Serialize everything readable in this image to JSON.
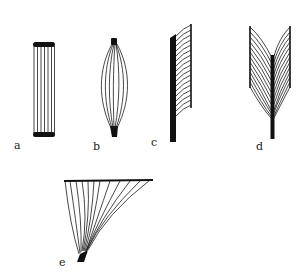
{
  "diagram": {
    "colors": {
      "ink": "#111111",
      "background": "#ffffff"
    },
    "panels": [
      {
        "id": "a",
        "label": "a",
        "shape": "parallel (strap) fibers"
      },
      {
        "id": "b",
        "label": "b",
        "shape": "fusiform fibers"
      },
      {
        "id": "c",
        "label": "c",
        "shape": "unipennate fibers"
      },
      {
        "id": "d",
        "label": "d",
        "shape": "bipennate fibers"
      },
      {
        "id": "e",
        "label": "e",
        "shape": "convergent (triangular) fibers"
      }
    ]
  }
}
